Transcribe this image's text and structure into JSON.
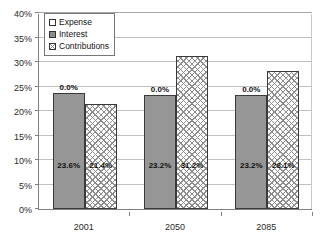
{
  "chart_data": {
    "type": "bar",
    "title": "",
    "subtitle": "",
    "xlabel": "",
    "ylabel": "",
    "categories": [
      "2001",
      "2050",
      "2085"
    ],
    "series": [
      {
        "name": "Expense",
        "swatch": "white",
        "values": [
          0.0,
          0.0,
          0.0
        ],
        "labels": [
          "0.0%",
          "0.0%",
          "0.0%"
        ]
      },
      {
        "name": "Interest",
        "swatch": "solid-gray",
        "values": [
          23.6,
          23.2,
          23.2
        ],
        "labels": [
          "23.6%",
          "23.2%",
          "23.2%"
        ]
      },
      {
        "name": "Contributions",
        "swatch": "crosshatch",
        "values": [
          21.4,
          31.2,
          28.1
        ],
        "labels": [
          "21.4%",
          "31.2%",
          "28.1%"
        ]
      }
    ],
    "ylim": [
      0,
      40
    ],
    "ytick_values": [
      0,
      5,
      10,
      15,
      20,
      25,
      30,
      35,
      40
    ],
    "ytick_labels": [
      "0%",
      "5%",
      "10%",
      "15%",
      "20%",
      "25%",
      "30%",
      "35%",
      "40%"
    ],
    "grid": true,
    "grid_axis": "y",
    "legend_position": "upper-left-inside",
    "legend_entries": [
      "Expense",
      "Interest",
      "Contributions"
    ]
  },
  "colors": {
    "bar_solid": "#969696",
    "bar_hatch_line": "#8d8d8d",
    "bar_border": "#3a3a3a",
    "gridline": "#c0c0c0",
    "axis": "#808080",
    "text": "#1a1a1a",
    "background": "#ffffff"
  }
}
